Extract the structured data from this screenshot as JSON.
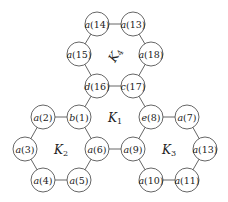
{
  "nodes": [
    {
      "id": "n14",
      "label": "a(14)",
      "x": 97,
      "y": 24
    },
    {
      "id": "n13a",
      "label": "a(13)",
      "x": 133,
      "y": 24
    },
    {
      "id": "n15",
      "label": "a(15)",
      "x": 79,
      "y": 54
    },
    {
      "id": "n18",
      "label": "a(18)",
      "x": 151,
      "y": 54
    },
    {
      "id": "n16",
      "label": "d(16)",
      "x": 97,
      "y": 86
    },
    {
      "id": "n17",
      "label": "c(17)",
      "x": 133,
      "y": 86
    },
    {
      "id": "n2",
      "label": "a(2)",
      "x": 43,
      "y": 117
    },
    {
      "id": "n1",
      "label": "b(1)",
      "x": 79,
      "y": 117
    },
    {
      "id": "n3",
      "label": "a(3)",
      "x": 25,
      "y": 149
    },
    {
      "id": "n6",
      "label": "a(6)",
      "x": 97,
      "y": 149
    },
    {
      "id": "n4",
      "label": "a(4)",
      "x": 43,
      "y": 180
    },
    {
      "id": "n5",
      "label": "a(5)",
      "x": 79,
      "y": 180
    },
    {
      "id": "n8",
      "label": "e(8)",
      "x": 151,
      "y": 117
    },
    {
      "id": "n7",
      "label": "a(7)",
      "x": 187,
      "y": 117
    },
    {
      "id": "n9",
      "label": "a(9)",
      "x": 133,
      "y": 149
    },
    {
      "id": "n13b",
      "label": "a(13)",
      "x": 205,
      "y": 149
    },
    {
      "id": "n10",
      "label": "a(10)",
      "x": 151,
      "y": 180
    },
    {
      "id": "n11",
      "label": "a(11)",
      "x": 187,
      "y": 180
    }
  ],
  "edges": [
    [
      "n14",
      "n13a"
    ],
    [
      "n14",
      "n15"
    ],
    [
      "n13a",
      "n18"
    ],
    [
      "n15",
      "n16"
    ],
    [
      "n18",
      "n17"
    ],
    [
      "n16",
      "n17"
    ],
    [
      "n16",
      "n1"
    ],
    [
      "n17",
      "n8"
    ],
    [
      "n2",
      "n1"
    ],
    [
      "n2",
      "n3"
    ],
    [
      "n1",
      "n6"
    ],
    [
      "n3",
      "n4"
    ],
    [
      "n6",
      "n5"
    ],
    [
      "n4",
      "n5"
    ],
    [
      "n6",
      "n9"
    ],
    [
      "n8",
      "n7"
    ],
    [
      "n8",
      "n9"
    ],
    [
      "n7",
      "n13b"
    ],
    [
      "n9",
      "n10"
    ],
    [
      "n13b",
      "n11"
    ],
    [
      "n10",
      "n11"
    ]
  ],
  "regions": [
    {
      "id": "K1",
      "main": "K",
      "sub": "1",
      "x": 115,
      "y": 118,
      "rotate": 0
    },
    {
      "id": "K2",
      "main": "K",
      "sub": "2",
      "x": 61,
      "y": 150,
      "rotate": 0
    },
    {
      "id": "K3",
      "main": "K",
      "sub": "3",
      "x": 169,
      "y": 150,
      "rotate": 0
    },
    {
      "id": "K4",
      "main": "K",
      "sub": "4",
      "x": 115,
      "y": 55,
      "rotate": -60
    }
  ],
  "node_radius": 12
}
